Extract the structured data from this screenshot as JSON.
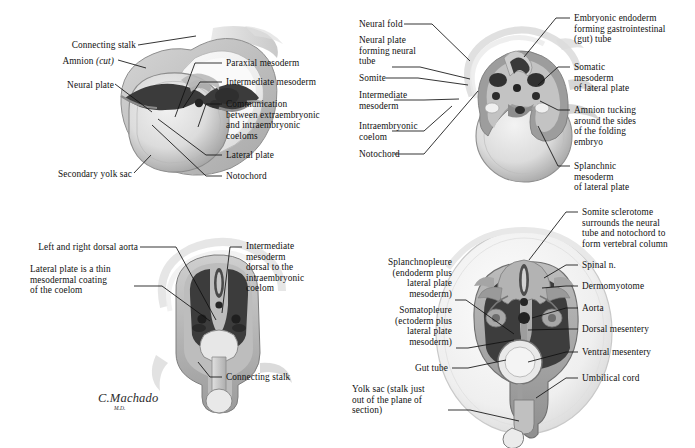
{
  "figure": {
    "artist_signature": "C.Machado",
    "artist_credential": "M.D.",
    "palette": {
      "ink": "#111111",
      "cavity_dark": "#3a3a3a",
      "tissue_mid": "#9a9a9a",
      "tissue_light": "#d8d8d8",
      "yolk_light": "#e8e8e8",
      "amnion_pale": "#f2f2f2",
      "background": "#ffffff"
    }
  },
  "panels": [
    {
      "id": "panel-top-left",
      "name": "early-folding-neural-plate-stage",
      "labels": [
        {
          "key": "connecting_stalk",
          "text": "Connecting stalk"
        },
        {
          "key": "amnion_cut_a",
          "text": "Amnion "
        },
        {
          "key": "amnion_cut_b",
          "text": "(cut)"
        },
        {
          "key": "neural_plate",
          "text": "Neural plate"
        },
        {
          "key": "secondary_yolk_sac",
          "text": "Secondary yolk sac"
        },
        {
          "key": "paraxial_mesoderm",
          "text": "Paraxial mesoderm"
        },
        {
          "key": "intermediate_mesoderm",
          "text": "Intermediate mesoderm"
        },
        {
          "key": "communication",
          "text": "Communication\nbetween extraembryonic\nand intraembryonic\ncoeloms"
        },
        {
          "key": "lateral_plate",
          "text": "Lateral plate"
        },
        {
          "key": "notochord",
          "text": "Notochord"
        }
      ]
    },
    {
      "id": "panel-top-right",
      "name": "neural-tube-forming-stage",
      "labels": [
        {
          "key": "neural_fold",
          "text": "Neural fold"
        },
        {
          "key": "neural_plate_tube",
          "text": "Neural plate\nforming neural\ntube"
        },
        {
          "key": "somite",
          "text": "Somite"
        },
        {
          "key": "intermediate_mesoderm",
          "text": "Intermediate\nmesoderm"
        },
        {
          "key": "intraembryonic_coelom",
          "text": "Intraembryonic\ncoelom"
        },
        {
          "key": "notochord",
          "text": "Notochord"
        },
        {
          "key": "embryonic_endoderm",
          "text": "Embryonic endoderm\nforming gastrointestinal\n(gut) tube"
        },
        {
          "key": "somatic_mesoderm",
          "text": "Somatic\nmesoderm\nof lateral plate"
        },
        {
          "key": "amnion_tucking",
          "text": "Amnion tucking\naround the sides\nof the folding\nembryo"
        },
        {
          "key": "splanchnic_mesoderm",
          "text": "Splanchnic\nmesoderm\nof lateral plate"
        }
      ]
    },
    {
      "id": "panel-bottom-left",
      "name": "dorsal-aorta-coelom-stage",
      "labels": [
        {
          "key": "dorsal_aorta",
          "text": "Left and right dorsal aorta"
        },
        {
          "key": "lateral_plate_thin",
          "text": "Lateral plate is a thin\nmesodermal coating\nof the coelom"
        },
        {
          "key": "intermediate_mesoderm_dorsal",
          "text": "Intermediate\nmesoderm\ndorsal to the\nintraembryonic\ncoelom"
        },
        {
          "key": "connecting_stalk",
          "text": "Connecting stalk"
        }
      ]
    },
    {
      "id": "panel-bottom-right",
      "name": "vertebral-column-gut-tube-stage",
      "labels": [
        {
          "key": "splanchnopleure",
          "text": "Splanchnopleure\n(endoderm plus\nlateral plate\nmesoderm)"
        },
        {
          "key": "somatopleure",
          "text": "Somatopleure\n(ectoderm plus\nlateral plate\nmesoderm)"
        },
        {
          "key": "gut_tube",
          "text": "Gut tube"
        },
        {
          "key": "yolk_sac",
          "text": "Yolk sac (stalk just\nout of the plane of\nsection)"
        },
        {
          "key": "somite_sclerotome",
          "text": "Somite sclerotome\nsurrounds the neural\ntube and notochord to\nform vertebral column"
        },
        {
          "key": "spinal_n",
          "text": "Spinal n."
        },
        {
          "key": "dermomyotome",
          "text": "Dermomyotome"
        },
        {
          "key": "aorta",
          "text": "Aorta"
        },
        {
          "key": "dorsal_mesentery",
          "text": "Dorsal mesentery"
        },
        {
          "key": "ventral_mesentery",
          "text": "Ventral mesentery"
        },
        {
          "key": "umbilical_cord",
          "text": "Umbilical cord"
        }
      ]
    }
  ]
}
